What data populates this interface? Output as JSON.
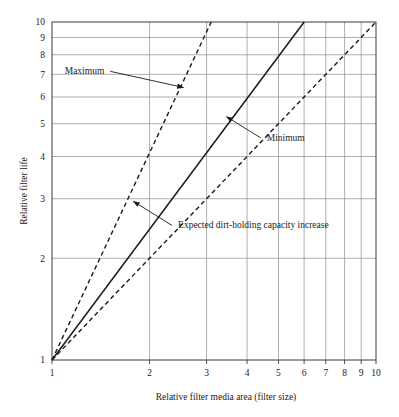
{
  "chart_data": {
    "type": "line",
    "title": "",
    "xlabel": "Relative filter media area (filter size)",
    "ylabel": "Relative filter life",
    "xscale": "log",
    "yscale": "log",
    "xlim": [
      1,
      10
    ],
    "ylim": [
      1,
      10
    ],
    "xticks": [
      1,
      2,
      3,
      4,
      5,
      6,
      7,
      8,
      9,
      10
    ],
    "yticks": [
      1,
      2,
      3,
      4,
      5,
      6,
      7,
      8,
      9,
      10
    ],
    "xtick_labels": [
      "1",
      "2",
      "3",
      "4",
      "5",
      "6",
      "7",
      "8",
      "9",
      "10"
    ],
    "ytick_labels": [
      "1",
      "2",
      "3",
      "4",
      "5",
      "6",
      "7",
      "8",
      "9",
      "10"
    ],
    "grid": true,
    "grid_axes": "both",
    "legend": "none",
    "series": [
      {
        "name": "Maximum",
        "style": "dashed",
        "points": [
          [
            1,
            1
          ],
          [
            3.1,
            10
          ]
        ],
        "exponent": 2.03,
        "note": "Steepest boundary; exits top of plot near x = 3.1"
      },
      {
        "name": "Expected dirt-holding capacity increase",
        "style": "solid",
        "points": [
          [
            1,
            1
          ],
          [
            6,
            10
          ]
        ],
        "exponent": 1.28,
        "note": "Central solid trend line reaching (6, 10)"
      },
      {
        "name": "Minimum",
        "style": "dashed",
        "points": [
          [
            1,
            1
          ],
          [
            10,
            10
          ]
        ],
        "exponent": 1.0,
        "note": "Shallowest boundary; 1:1 proportional line reaching (10, 10)"
      }
    ],
    "annotations": [
      {
        "text": "Maximum",
        "target_series": "Maximum",
        "text_xy": [
          1.45,
          7.0
        ],
        "arrow_to": [
          2.55,
          6.4
        ],
        "arrow_direction": "down-right"
      },
      {
        "text": "Minimum",
        "target_series": "Minimum",
        "text_xy": [
          4.6,
          4.45
        ],
        "arrow_to": [
          3.45,
          5.25
        ],
        "arrow_direction": "up-left"
      },
      {
        "text": "Expected dirt-holding capacity increase",
        "target_series": "Expected dirt-holding capacity increase",
        "text_xy": [
          2.45,
          2.45
        ],
        "arrow_to": [
          1.78,
          2.95
        ],
        "arrow_direction": "up-left"
      }
    ]
  },
  "colors": {
    "background": "#ffffff",
    "grid": "#8c8c8c",
    "frame": "#3a3a3a",
    "line": "#1a1a1a",
    "text": "#1a1a1a"
  }
}
